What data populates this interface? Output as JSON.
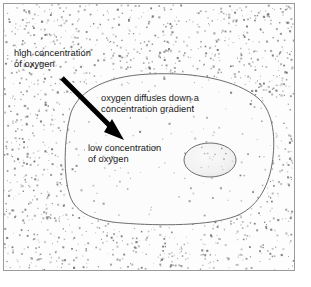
{
  "figure": {
    "width": 311,
    "height": 287,
    "background_color": "#ffffff",
    "frame_color": "#9b9b9b"
  },
  "labels": {
    "high_concentration": "high concentration\nof oxygen",
    "diffusion": "oxygen diffuses down a\nconcentration gradient",
    "low_concentration": "low concentration\nof oxygen"
  },
  "arrow": {
    "name": "diffusion-arrow",
    "color": "#000000",
    "start_x": 62,
    "start_y": 78,
    "end_x": 124,
    "end_y": 140,
    "shaft_width": 5,
    "head_length": 17,
    "head_width": 13
  },
  "cell": {
    "name": "cell-membrane",
    "stroke_color": "#6e6e6e",
    "fill_color": "#fcfcfc",
    "stroke_width": 1
  },
  "nucleus": {
    "name": "nucleus",
    "stroke_color": "#6e6e6e",
    "fill_color": "#f2f2f2",
    "center_x": 210,
    "center_y": 160,
    "radius_x": 26,
    "radius_y": 17
  },
  "stipple": {
    "name": "oxygen-molecule-stipple",
    "dot_color": "#6b6b6b",
    "outside_label": "high concentration of oxygen",
    "inside_label": "low concentration of oxygen",
    "outside_count": 2100,
    "inside_count": 190
  },
  "colors": {
    "text": "#191919",
    "frame": "#9b9b9b",
    "outline": "#6e6e6e",
    "arrow": "#000000",
    "dot": "#6b6b6b"
  }
}
